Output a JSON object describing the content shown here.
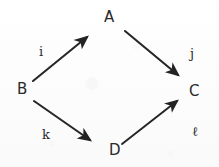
{
  "diagram": {
    "ink_color": "#2a2a2a",
    "background_color": "#fdfdfd",
    "nodes": [
      {
        "id": "A",
        "label": "A",
        "x": 111,
        "y": 18
      },
      {
        "id": "B",
        "label": "B",
        "x": 23,
        "y": 90
      },
      {
        "id": "C",
        "label": "C",
        "x": 195,
        "y": 92
      },
      {
        "id": "D",
        "label": "D",
        "x": 115,
        "y": 151
      }
    ],
    "edges": [
      {
        "id": "i",
        "label": "i",
        "from": "B",
        "to": "A",
        "x1": 33,
        "y1": 81,
        "x2": 89,
        "y2": 35,
        "label_x": 39,
        "label_y": 45
      },
      {
        "id": "j",
        "label": "j",
        "from": "A",
        "to": "C",
        "x1": 125,
        "y1": 31,
        "x2": 181,
        "y2": 78,
        "label_x": 190,
        "label_y": 47
      },
      {
        "id": "k",
        "label": "k",
        "from": "B",
        "to": "D",
        "x1": 34,
        "y1": 101,
        "x2": 93,
        "y2": 143,
        "label_x": 42,
        "label_y": 128
      },
      {
        "id": "l",
        "label": "ℓ",
        "from": "D",
        "to": "C",
        "x1": 122,
        "y1": 144,
        "x2": 180,
        "y2": 98,
        "label_x": 192,
        "label_y": 125
      }
    ]
  }
}
